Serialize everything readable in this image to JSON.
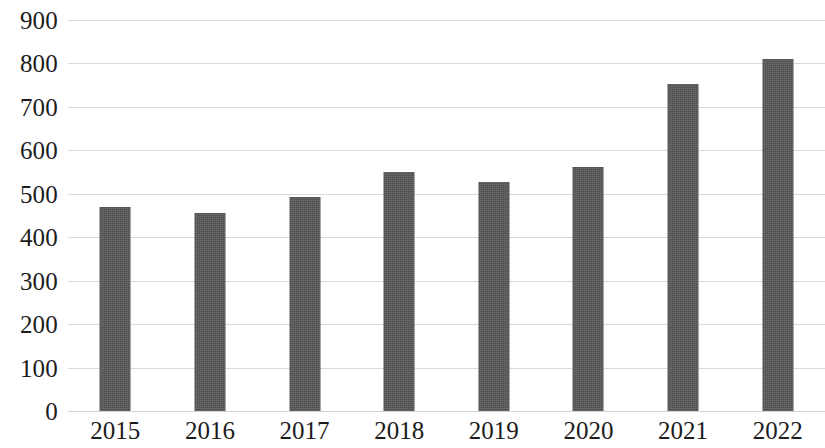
{
  "chart_data": {
    "type": "bar",
    "title": "",
    "subtitle": "",
    "xlabel": "",
    "ylabel": "",
    "categories": [
      "2015",
      "2016",
      "2017",
      "2018",
      "2019",
      "2020",
      "2021",
      "2022"
    ],
    "values": [
      470,
      455,
      493,
      550,
      528,
      562,
      753,
      810
    ],
    "series": [
      {
        "name": "",
        "values": [
          470,
          455,
          493,
          550,
          528,
          562,
          753,
          810
        ]
      }
    ],
    "ylim": [
      0,
      900
    ],
    "y_ticks": [
      0,
      100,
      200,
      300,
      400,
      500,
      600,
      700,
      800,
      900
    ],
    "y_tick_labels": [
      "0",
      "100",
      "200",
      "300",
      "400",
      "500",
      "600",
      "700",
      "800",
      "900"
    ],
    "grid": true,
    "grid_axis": "y",
    "legend": false,
    "legend_position": "none",
    "bar_color": "#58585a",
    "grid_color": "#d9d9d9",
    "background_color": "#ffffff",
    "text_color": "#1c1c1c",
    "annotations": []
  }
}
